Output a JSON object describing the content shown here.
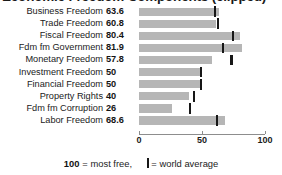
{
  "title": {
    "text": "Economic Freedom Components (clipped)",
    "clipped": true
  },
  "chart_data": {
    "type": "bar",
    "orientation": "horizontal",
    "title": "",
    "xlabel": "",
    "ylabel": "",
    "xlim": [
      0,
      100
    ],
    "xticks": [
      0,
      50,
      100
    ],
    "xticklabels": [
      "0",
      "50",
      "100"
    ],
    "grid": false,
    "bar_color": "#b6b6b6",
    "marker_color": "#171717",
    "categories": [
      "Business Freedom",
      "Trade Freedom",
      "Fiscal Freedom",
      "Fdm fm Government",
      "Monetary Freedom",
      "Investment Freedom",
      "Financial Freedom",
      "Property Rights",
      "Fdm fm Corruption",
      "Labor Freedom"
    ],
    "values": [
      63.6,
      60.8,
      80.4,
      81.9,
      57.8,
      50,
      50,
      40,
      26,
      68.6
    ],
    "value_labels": [
      "63.6",
      "60.8",
      "80.4",
      "81.9",
      "57.8",
      "50",
      "50",
      "40",
      "26",
      "68.6"
    ],
    "world_average": [
      60.3,
      62.5,
      74.9,
      66.6,
      73.4,
      49.4,
      49.2,
      43.8,
      40.5,
      62.1
    ],
    "series": [
      {
        "name": "Country score",
        "values": [
          63.6,
          60.8,
          80.4,
          81.9,
          57.8,
          50,
          50,
          40,
          26,
          68.6
        ]
      },
      {
        "name": "World average",
        "values": [
          60.3,
          62.5,
          74.9,
          66.6,
          73.4,
          49.4,
          49.2,
          43.8,
          40.5,
          62.1
        ]
      }
    ]
  },
  "legend": {
    "max_value": "100",
    "max_text": "= most free,",
    "marker_glyph": "|",
    "marker_text": "= world average"
  }
}
